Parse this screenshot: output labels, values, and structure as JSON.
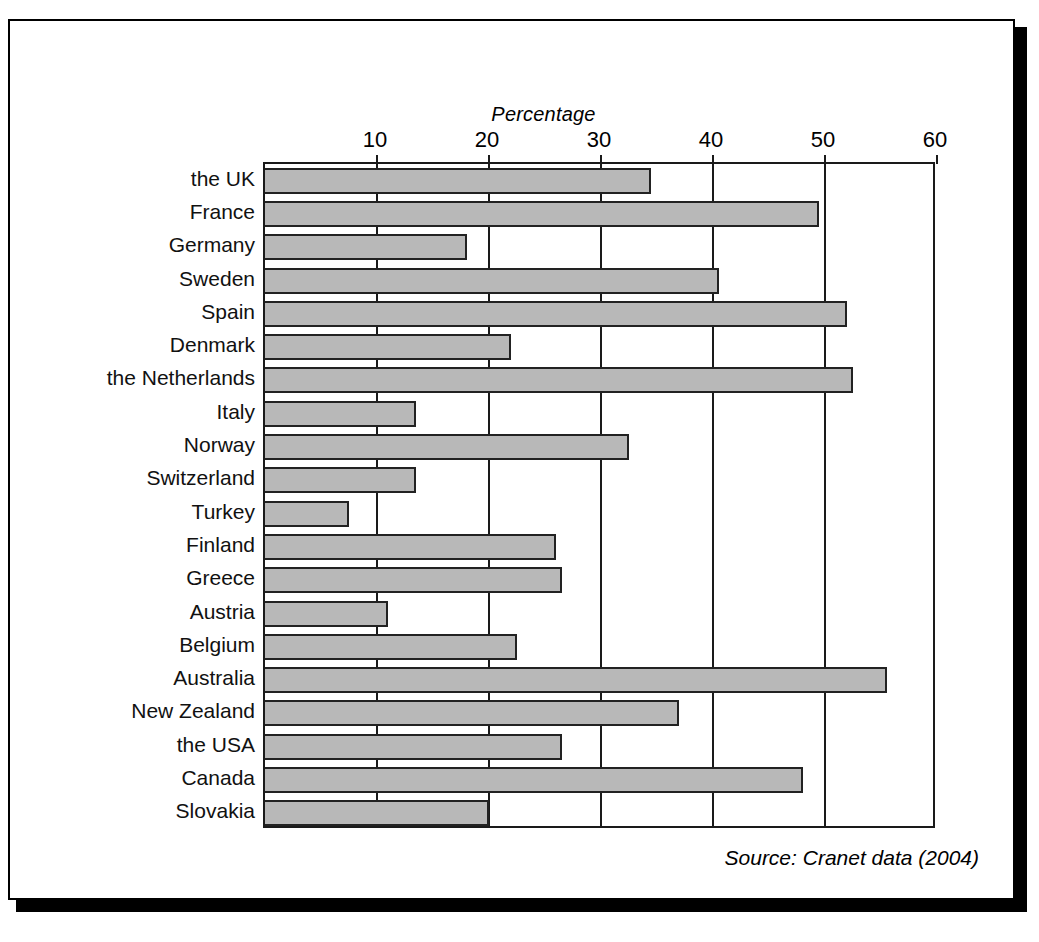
{
  "figure": {
    "source_note": "Source: Cranet data (2004)"
  },
  "chart_data": {
    "type": "bar",
    "orientation": "horizontal",
    "title": "",
    "xlabel": "Percentage",
    "ylabel": "",
    "xlim": [
      0,
      60
    ],
    "xticks": [
      10,
      20,
      30,
      40,
      50,
      60
    ],
    "xtick_labels": [
      "10",
      "20",
      "30",
      "40",
      "50",
      "60"
    ],
    "grid": true,
    "legend": "none",
    "bar_color": "#b8b8b8",
    "bar_edge_color": "#222222",
    "categories": [
      "the UK",
      "France",
      "Germany",
      "Sweden",
      "Spain",
      "Denmark",
      "the Netherlands",
      "Italy",
      "Norway",
      "Switzerland",
      "Turkey",
      "Finland",
      "Greece",
      "Austria",
      "Belgium",
      "Australia",
      "New Zealand",
      "the USA",
      "Canada",
      "Slovakia"
    ],
    "values": [
      34.5,
      49.5,
      18.0,
      40.5,
      52.0,
      22.0,
      52.5,
      13.5,
      32.5,
      13.5,
      7.5,
      26.0,
      26.5,
      11.0,
      22.5,
      55.5,
      37.0,
      26.5,
      48.0,
      20.0
    ]
  }
}
